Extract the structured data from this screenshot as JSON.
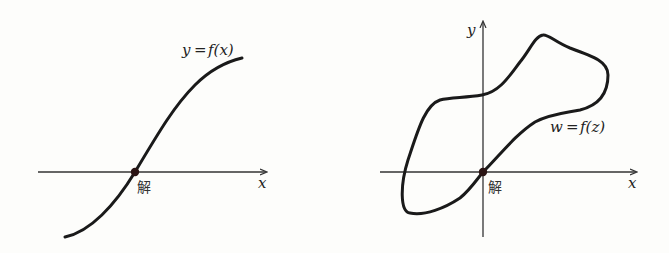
{
  "left_panel": {
    "curve_label_lhs": "y",
    "curve_label_eq": "=",
    "curve_label_rhs": "f(x)",
    "x_axis_label": "x",
    "root_label": "解",
    "curve_type": "monotonic S-shaped curve crossing x-axis once"
  },
  "right_panel": {
    "curve_label_lhs": "w",
    "curve_label_eq": "=",
    "curve_label_rhs": "f(z)",
    "x_axis_label": "x",
    "y_axis_label": "y",
    "root_label": "解",
    "curve_type": "closed loop curve passing through the origin"
  },
  "colors": {
    "background": "#fdfdfb",
    "ink": "#1a1a1a",
    "axis": "#333333"
  }
}
